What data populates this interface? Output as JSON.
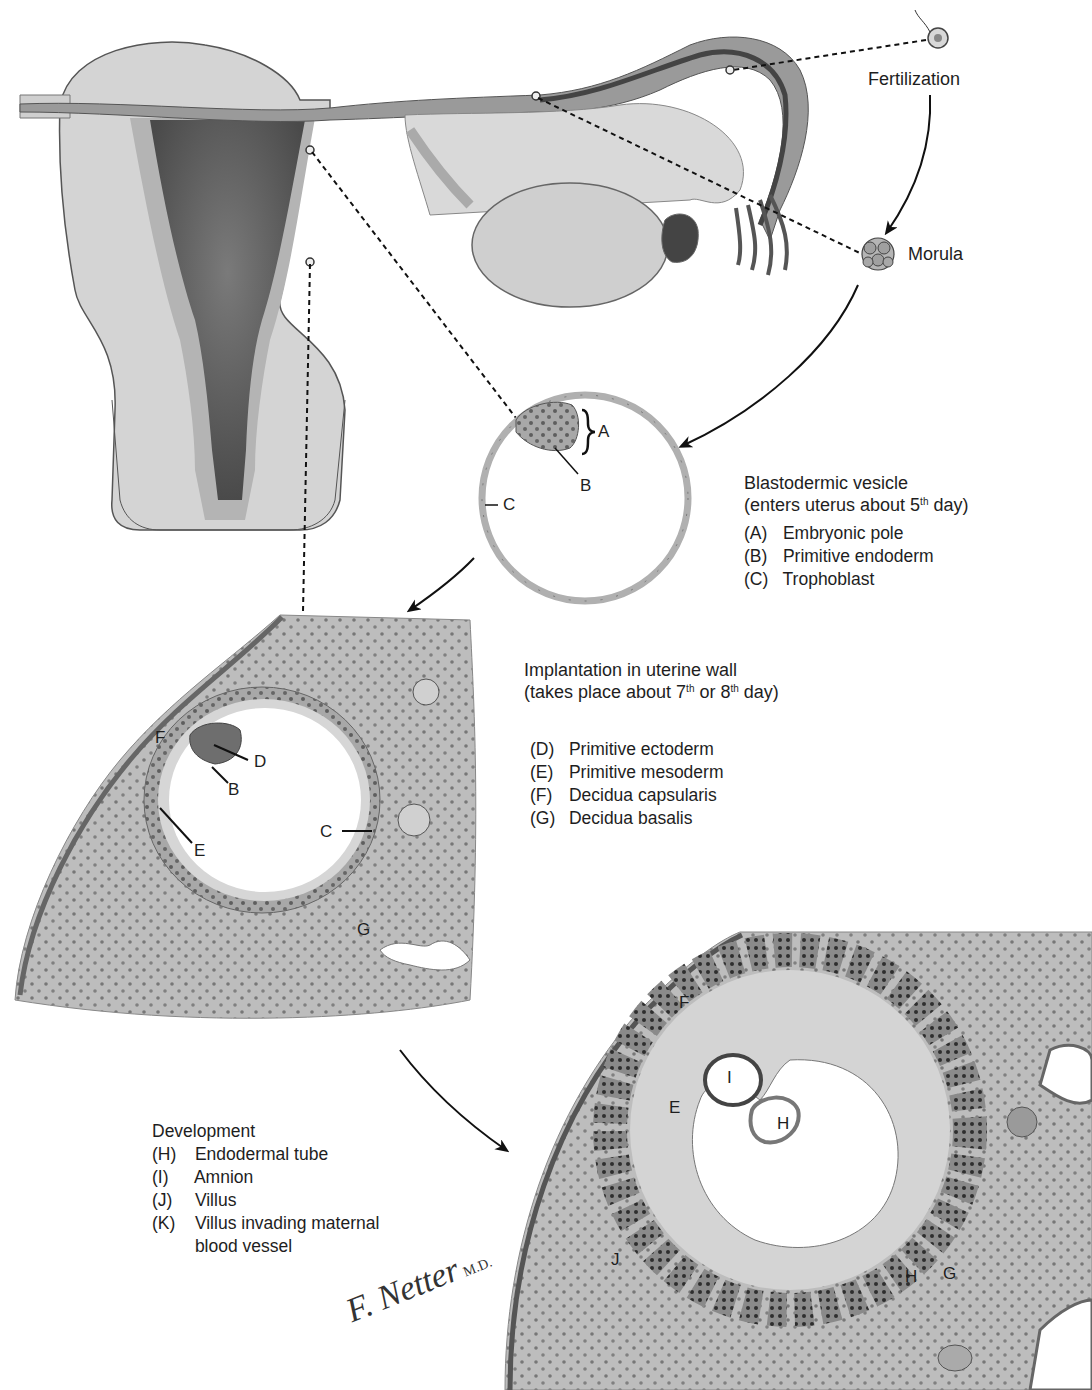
{
  "diagram": {
    "stages": {
      "fertilization": "Fertilization",
      "morula": "Morula"
    },
    "blastocyst": {
      "title": "Blastodermic vesicle",
      "subtitle_pre": "(enters uterus about 5",
      "subtitle_sup": "th",
      "subtitle_post": " day)",
      "legend": [
        {
          "key": "(A)",
          "text": "Embryonic pole"
        },
        {
          "key": "(B)",
          "text": "Primitive endoderm"
        },
        {
          "key": "(C)",
          "text": "Trophoblast"
        }
      ],
      "labels": {
        "A": "A",
        "B": "B",
        "C": "C"
      }
    },
    "implantation": {
      "title": "Implantation in uterine wall",
      "subtitle_pre": "(takes place about 7",
      "subtitle_sup1": "th",
      "subtitle_mid": " or 8",
      "subtitle_sup2": "th",
      "subtitle_post": " day)",
      "legend": [
        {
          "key": "(D)",
          "text": "Primitive ectoderm"
        },
        {
          "key": "(E)",
          "text": "Primitive mesoderm"
        },
        {
          "key": "(F)",
          "text": "Decidua capsularis"
        },
        {
          "key": "(G)",
          "text": "Decidua basalis"
        }
      ],
      "labels": {
        "F": "F",
        "D": "D",
        "B": "B",
        "E": "E",
        "C": "C",
        "G": "G"
      }
    },
    "development": {
      "title": "Development",
      "legend": [
        {
          "key": "(H)",
          "text": "Endodermal tube"
        },
        {
          "key": "(I)",
          "text": "Amnion"
        },
        {
          "key": "(J)",
          "text": "Villus"
        },
        {
          "key": "(K)",
          "text": "Villus invading maternal"
        },
        {
          "key": "",
          "text": "blood vessel"
        }
      ],
      "labels": {
        "F": "F",
        "I": "I",
        "E": "E",
        "H": "H",
        "J": "J",
        "G": "G",
        "H2": "H"
      }
    },
    "signature": {
      "name": "F. Netter",
      "suffix": "M.D."
    },
    "colors": {
      "tissue_light": "#c9c9c9",
      "tissue_mid": "#a9a9a9",
      "tissue_dark": "#6e6e6e",
      "cavity_dark": "#5a5a5a",
      "cell_dot": "#4d4d4d",
      "line": "#111111"
    }
  }
}
